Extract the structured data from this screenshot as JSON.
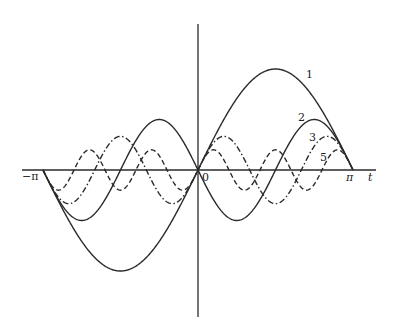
{
  "chart_data": {
    "type": "line",
    "title": "",
    "xlabel": "t",
    "ylabel": "",
    "xlim": [
      -3.14159,
      3.14159
    ],
    "x_ticks": [
      {
        "value": -3.14159,
        "label": "−π"
      },
      {
        "value": 0,
        "label": "0"
      },
      {
        "value": 3.14159,
        "label": "π"
      }
    ],
    "grid": false,
    "legend": "inline curve labels",
    "series": [
      {
        "name": "1",
        "formula": "2 sin(t)",
        "amplitude": 2,
        "harmonic": 1,
        "sign": 1,
        "style": "solid"
      },
      {
        "name": "2",
        "formula": "-sin(2t)",
        "amplitude": 1,
        "harmonic": 2,
        "sign": -1,
        "style": "solid"
      },
      {
        "name": "3",
        "formula": "(2/3) sin(3t)",
        "amplitude": 0.6667,
        "harmonic": 3,
        "sign": 1,
        "style": "dash-dot"
      },
      {
        "name": "5",
        "formula": "(2/5) sin(5t)",
        "amplitude": 0.4,
        "harmonic": 5,
        "sign": 1,
        "style": "dashed"
      }
    ],
    "annotations": [
      {
        "text": "1",
        "x": 306,
        "y": 78
      },
      {
        "text": "2",
        "x": 298,
        "y": 121
      },
      {
        "text": "3",
        "x": 309,
        "y": 141
      },
      {
        "text": "5",
        "x": 320,
        "y": 161
      }
    ]
  },
  "axes": {
    "x_label": "t",
    "neg_pi_label": "−π",
    "origin_label": "0",
    "pi_label": "π"
  }
}
